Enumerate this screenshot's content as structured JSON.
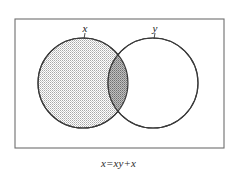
{
  "figure": {
    "name": "venn-diagram-absorption-law",
    "caption": "x=xy+x",
    "universe": {
      "name": "universal-set-rectangle",
      "border_color": "#6e6e6e",
      "fill_color": "#ffffff"
    },
    "sets": [
      {
        "id": "x",
        "label": "x",
        "shaded": true,
        "fill_color": "#d8d8d8",
        "stroke_color": "#3a3a3a",
        "cx": 83,
        "cy": 83,
        "r": 45
      },
      {
        "id": "y",
        "label": "y",
        "shaded": false,
        "fill_color": "#ffffff",
        "stroke_color": "#3a3a3a",
        "cx": 153,
        "cy": 83,
        "r": 45
      }
    ],
    "intersection": {
      "name": "intersection-region",
      "fill_color": "#b0b0b0",
      "shaded": true
    }
  }
}
